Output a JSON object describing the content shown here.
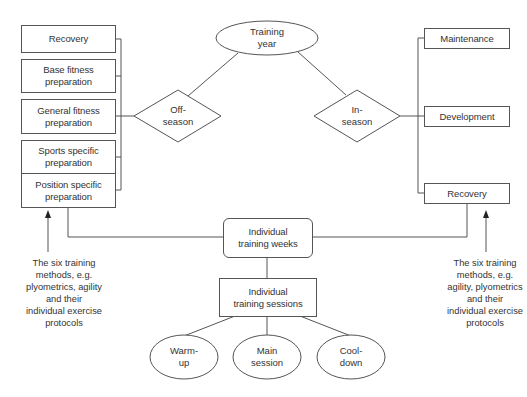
{
  "diagram": {
    "root": {
      "label_line1": "Training",
      "label_line2": "year"
    },
    "off_season": {
      "label_line1": "Off-",
      "label_line2": "season",
      "phases": [
        {
          "line1": "Recovery",
          "line2": ""
        },
        {
          "line1": "Base fitness",
          "line2": "preparation"
        },
        {
          "line1": "General fitness",
          "line2": "preparation"
        },
        {
          "line1": "Sports specific",
          "line2": "preparation"
        },
        {
          "line1": "Position specific",
          "line2": "preparation"
        }
      ],
      "annotation": [
        "The six training",
        "methods, e.g.",
        "plyometrics, agility",
        "and their",
        "individual exercise",
        "protocols"
      ]
    },
    "in_season": {
      "label_line1": "In-",
      "label_line2": "season",
      "phases": [
        {
          "line1": "Maintenance"
        },
        {
          "line1": "Development"
        },
        {
          "line1": "Recovery"
        }
      ],
      "annotation": [
        "The six training",
        "methods, e.g.",
        "agility, plyometrics",
        "and their",
        "individual exercise",
        "protocols"
      ]
    },
    "weeks": {
      "line1": "Individual",
      "line2": "training weeks"
    },
    "sessions": {
      "line1": "Individual",
      "line2": "training sessions"
    },
    "session_parts": [
      {
        "line1": "Warm-",
        "line2": "up"
      },
      {
        "line1": "Main",
        "line2": "session"
      },
      {
        "line1": "Cool-",
        "line2": "down"
      }
    ],
    "colors": {
      "line": "#555555",
      "text": "#333333",
      "background": "#ffffff"
    }
  }
}
